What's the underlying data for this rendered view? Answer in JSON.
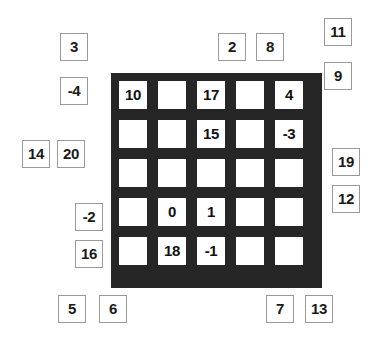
{
  "board": {
    "rows": 5,
    "cols": 5,
    "background_color": "#262626",
    "cell_color": "#ffffff",
    "cells": [
      [
        "10",
        "",
        "17",
        "",
        "4"
      ],
      [
        "",
        "",
        "15",
        "",
        "-3"
      ],
      [
        "",
        "",
        "",
        "",
        ""
      ],
      [
        "",
        "0",
        "1",
        "",
        ""
      ],
      [
        "",
        "18",
        "-1",
        "",
        ""
      ]
    ]
  },
  "loose_tiles": [
    {
      "label": "3",
      "x": 60,
      "y": 33
    },
    {
      "label": "2",
      "x": 218,
      "y": 33
    },
    {
      "label": "8",
      "x": 256,
      "y": 33
    },
    {
      "label": "11",
      "x": 324,
      "y": 18
    },
    {
      "label": "9",
      "x": 324,
      "y": 62
    },
    {
      "label": "-4",
      "x": 60,
      "y": 77
    },
    {
      "label": "14",
      "x": 22,
      "y": 140
    },
    {
      "label": "20",
      "x": 57,
      "y": 140
    },
    {
      "label": "19",
      "x": 332,
      "y": 148
    },
    {
      "label": "12",
      "x": 332,
      "y": 185
    },
    {
      "label": "-2",
      "x": 75,
      "y": 203
    },
    {
      "label": "16",
      "x": 75,
      "y": 240
    },
    {
      "label": "5",
      "x": 58,
      "y": 295
    },
    {
      "label": "6",
      "x": 99,
      "y": 295
    },
    {
      "label": "7",
      "x": 266,
      "y": 295
    },
    {
      "label": "13",
      "x": 305,
      "y": 295
    }
  ]
}
